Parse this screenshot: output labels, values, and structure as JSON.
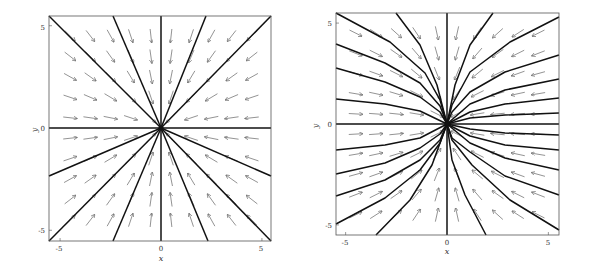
{
  "chart_data": [
    {
      "type": "quiver",
      "title": "",
      "xlabel": "x",
      "ylabel": "y",
      "xlim": [
        -5.5,
        5.5
      ],
      "ylim": [
        -5.5,
        5.5
      ],
      "xticks": [
        "-5",
        "0",
        "5"
      ],
      "yticks": [
        "5",
        "0",
        "-5"
      ],
      "grid": false,
      "description": "Stable star node: vector field (x', y') = (-x, -y), all trajectories are straight lines into the origin",
      "frame_px": {
        "left": 49,
        "top": 16,
        "right": 271,
        "bottom": 241
      },
      "origin_px": [
        161,
        128
      ],
      "arrow_grid": {
        "x": [
          -4.5,
          -3.5,
          -2.5,
          -1.5,
          -0.5,
          0.5,
          1.5,
          2.5,
          3.5,
          4.5
        ],
        "y": [
          4.5,
          3.5,
          2.5,
          1.5,
          0.5,
          -0.5,
          -1.5,
          -2.5,
          -3.5,
          -4.5
        ]
      },
      "vector_field": "radial_in",
      "trajectories_px": [
        [
          [
            49,
            16
          ],
          [
            161,
            128
          ]
        ],
        [
          [
            113,
            16
          ],
          [
            161,
            128
          ]
        ],
        [
          [
            161,
            16
          ],
          [
            161,
            128
          ]
        ],
        [
          [
            206,
            16
          ],
          [
            161,
            128
          ]
        ],
        [
          [
            271,
            16
          ],
          [
            161,
            128
          ]
        ],
        [
          [
            49,
            128
          ],
          [
            271,
            128
          ]
        ],
        [
          [
            49,
            176
          ],
          [
            161,
            128
          ]
        ],
        [
          [
            271,
            176
          ],
          [
            161,
            128
          ]
        ],
        [
          [
            49,
            241
          ],
          [
            161,
            128
          ]
        ],
        [
          [
            113,
            241
          ],
          [
            161,
            128
          ]
        ],
        [
          [
            161,
            241
          ],
          [
            161,
            128
          ]
        ],
        [
          [
            208,
            241
          ],
          [
            161,
            128
          ]
        ],
        [
          [
            271,
            241
          ],
          [
            161,
            128
          ]
        ]
      ]
    },
    {
      "type": "quiver",
      "title": "",
      "xlabel": "x",
      "ylabel": "y",
      "xlim": [
        -5.5,
        5.5
      ],
      "ylim": [
        -5.5,
        5.5
      ],
      "xticks": [
        "-5",
        "0",
        "5"
      ],
      "yticks": [
        "5",
        "0",
        "-5"
      ],
      "grid": false,
      "description": "Stable node with curved trajectories tangent to the y-axis at the origin",
      "frame_px": {
        "left": 336,
        "top": 13,
        "right": 559,
        "bottom": 235
      },
      "origin_px": [
        447,
        124
      ],
      "arrow_grid": {
        "x": [
          -4.5,
          -3.5,
          -2.5,
          -1.5,
          -0.5,
          0.5,
          1.5,
          2.5,
          3.5,
          4.5
        ],
        "y": [
          4.5,
          3.5,
          2.5,
          1.5,
          0.5,
          -0.5,
          -1.5,
          -2.5,
          -3.5,
          -4.5
        ]
      },
      "vector_field": "node_x_fast",
      "trajectory_edge_intercepts": {
        "left_edge_y": [
          5.5,
          4.0,
          2.8,
          1.25,
          -1.3,
          -2.5,
          -3.6,
          -5.0
        ],
        "right_edge_y": [
          5.3,
          3.4,
          2.2,
          1.3,
          0.55,
          -0.5,
          -1.3,
          -2.2,
          -3.4,
          -5.2
        ],
        "top_edge_x": [
          -2.5,
          2.3
        ],
        "bottom_edge_x": [
          -3.5,
          1.9
        ]
      },
      "trajectories_px": [
        [
          [
            336,
            13
          ],
          [
            390,
            42
          ],
          [
            425,
            73
          ],
          [
            440,
            100
          ],
          [
            447,
            124
          ]
        ],
        [
          [
            336,
            44
          ],
          [
            385,
            63
          ],
          [
            420,
            83
          ],
          [
            440,
            106
          ],
          [
            447,
            124
          ]
        ],
        [
          [
            336,
            68
          ],
          [
            385,
            82
          ],
          [
            420,
            97
          ],
          [
            440,
            112
          ],
          [
            447,
            124
          ]
        ],
        [
          [
            336,
            99
          ],
          [
            385,
            104
          ],
          [
            420,
            111
          ],
          [
            447,
            124
          ]
        ],
        [
          [
            396,
            13
          ],
          [
            420,
            45
          ],
          [
            437,
            85
          ],
          [
            447,
            124
          ]
        ],
        [
          [
            493,
            13
          ],
          [
            470,
            45
          ],
          [
            455,
            85
          ],
          [
            447,
            124
          ]
        ],
        [
          [
            559,
            17
          ],
          [
            510,
            42
          ],
          [
            470,
            72
          ],
          [
            452,
            105
          ],
          [
            447,
            124
          ]
        ],
        [
          [
            559,
            55
          ],
          [
            505,
            72
          ],
          [
            470,
            92
          ],
          [
            452,
            112
          ],
          [
            447,
            124
          ]
        ],
        [
          [
            559,
            79
          ],
          [
            505,
            90
          ],
          [
            470,
            104
          ],
          [
            447,
            124
          ]
        ],
        [
          [
            559,
            98
          ],
          [
            505,
            104
          ],
          [
            470,
            112
          ],
          [
            447,
            124
          ]
        ],
        [
          [
            559,
            113
          ],
          [
            505,
            115
          ],
          [
            470,
            118
          ],
          [
            447,
            124
          ]
        ],
        [
          [
            336,
            124
          ],
          [
            559,
            124
          ]
        ],
        [
          [
            447,
            13
          ],
          [
            447,
            235
          ]
        ],
        [
          [
            336,
            150
          ],
          [
            385,
            145
          ],
          [
            420,
            138
          ],
          [
            447,
            124
          ]
        ],
        [
          [
            336,
            174
          ],
          [
            385,
            163
          ],
          [
            420,
            148
          ],
          [
            440,
            134
          ],
          [
            447,
            124
          ]
        ],
        [
          [
            336,
            196
          ],
          [
            385,
            180
          ],
          [
            420,
            160
          ],
          [
            440,
            140
          ],
          [
            447,
            124
          ]
        ],
        [
          [
            336,
            224
          ],
          [
            385,
            198
          ],
          [
            420,
            170
          ],
          [
            440,
            143
          ],
          [
            447,
            124
          ]
        ],
        [
          [
            376,
            235
          ],
          [
            410,
            200
          ],
          [
            432,
            165
          ],
          [
            447,
            124
          ]
        ],
        [
          [
            486,
            235
          ],
          [
            465,
            195
          ],
          [
            452,
            160
          ],
          [
            447,
            124
          ]
        ],
        [
          [
            559,
            135
          ],
          [
            505,
            133
          ],
          [
            470,
            129
          ],
          [
            447,
            124
          ]
        ],
        [
          [
            559,
            150
          ],
          [
            505,
            145
          ],
          [
            470,
            136
          ],
          [
            447,
            124
          ]
        ],
        [
          [
            559,
            170
          ],
          [
            505,
            158
          ],
          [
            470,
            143
          ],
          [
            447,
            124
          ]
        ],
        [
          [
            559,
            195
          ],
          [
            505,
            176
          ],
          [
            470,
            152
          ],
          [
            452,
            138
          ],
          [
            447,
            124
          ]
        ],
        [
          [
            559,
            230
          ],
          [
            510,
            200
          ],
          [
            472,
            165
          ],
          [
            452,
            140
          ],
          [
            447,
            124
          ]
        ]
      ]
    }
  ]
}
